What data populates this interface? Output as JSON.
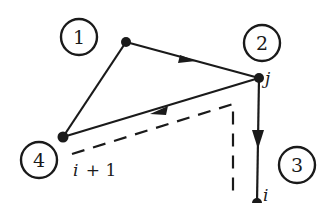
{
  "diagram": {
    "type": "directed-graph",
    "stroke_color": "#1a1a1a",
    "background": "#ffffff",
    "region_labels": [
      {
        "id": "1",
        "text": "1",
        "cx": 79,
        "cy": 37,
        "r": 18
      },
      {
        "id": "2",
        "text": "2",
        "cx": 262,
        "cy": 43,
        "r": 18
      },
      {
        "id": "3",
        "text": "3",
        "cx": 297,
        "cy": 165,
        "r": 18
      },
      {
        "id": "4",
        "text": "4",
        "cx": 39,
        "cy": 160,
        "r": 18
      }
    ],
    "nodes": [
      {
        "id": "top",
        "x": 126,
        "y": 42,
        "label": ""
      },
      {
        "id": "j",
        "x": 259,
        "y": 78,
        "label": "j"
      },
      {
        "id": "left",
        "x": 63,
        "y": 137,
        "label": "i + 1"
      },
      {
        "id": "i",
        "x": 257,
        "y": 203,
        "label": "i"
      }
    ],
    "edges": [
      {
        "from": "top",
        "to": "j",
        "arrow": "forward",
        "style": "solid"
      },
      {
        "from": "j",
        "to": "left",
        "arrow": "forward",
        "style": "solid"
      },
      {
        "from": "left",
        "to": "top",
        "arrow": "none",
        "style": "solid"
      },
      {
        "from": "j",
        "to": "i",
        "arrow": "forward",
        "style": "solid"
      }
    ],
    "dashed_path": {
      "points": [
        [
          72,
          154
        ],
        [
          233,
          104
        ],
        [
          233,
          192
        ]
      ],
      "style": "dashed"
    },
    "node_labels": {
      "j": "j",
      "i": "i",
      "i_plus_1": "i + 1"
    }
  }
}
